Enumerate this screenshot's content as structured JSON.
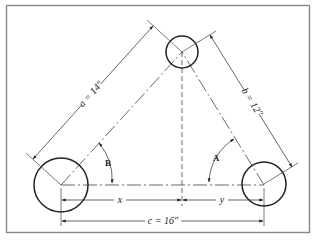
{
  "diagram": {
    "type": "technical-drawing",
    "colors": {
      "line": "#222222",
      "frame": "#888888",
      "background": "#ffffff"
    },
    "circles": [
      {
        "id": "top",
        "cx": 182,
        "cy": 52,
        "r": 16
      },
      {
        "id": "left",
        "cx": 61,
        "cy": 185,
        "r": 27
      },
      {
        "id": "right",
        "cx": 264,
        "cy": 184,
        "r": 22
      }
    ],
    "dimensions": {
      "a": {
        "label": "a = 14″",
        "side": "left-to-top"
      },
      "b": {
        "label": "b = 12″",
        "side": "top-to-right"
      },
      "c": {
        "label": "c = 16″",
        "side": "left-to-right"
      },
      "x": {
        "label": "x"
      },
      "y": {
        "label": "y"
      }
    },
    "angles": {
      "A": {
        "label": "A",
        "vertex": "right"
      },
      "B": {
        "label": "B",
        "vertex": "left"
      }
    }
  }
}
